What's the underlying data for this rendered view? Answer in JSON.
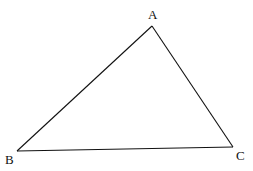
{
  "diagram": {
    "type": "triangle",
    "stroke_color": "#111111",
    "vertices": [
      {
        "name": "A",
        "x": 152,
        "y": 26,
        "label_x": 148,
        "label_y": 19
      },
      {
        "name": "B",
        "x": 17,
        "y": 151,
        "label_x": 5,
        "label_y": 164
      },
      {
        "name": "C",
        "x": 233,
        "y": 147,
        "label_x": 236,
        "label_y": 160
      }
    ],
    "edges": [
      {
        "from": "A",
        "to": "B"
      },
      {
        "from": "B",
        "to": "C"
      },
      {
        "from": "C",
        "to": "A"
      }
    ]
  }
}
